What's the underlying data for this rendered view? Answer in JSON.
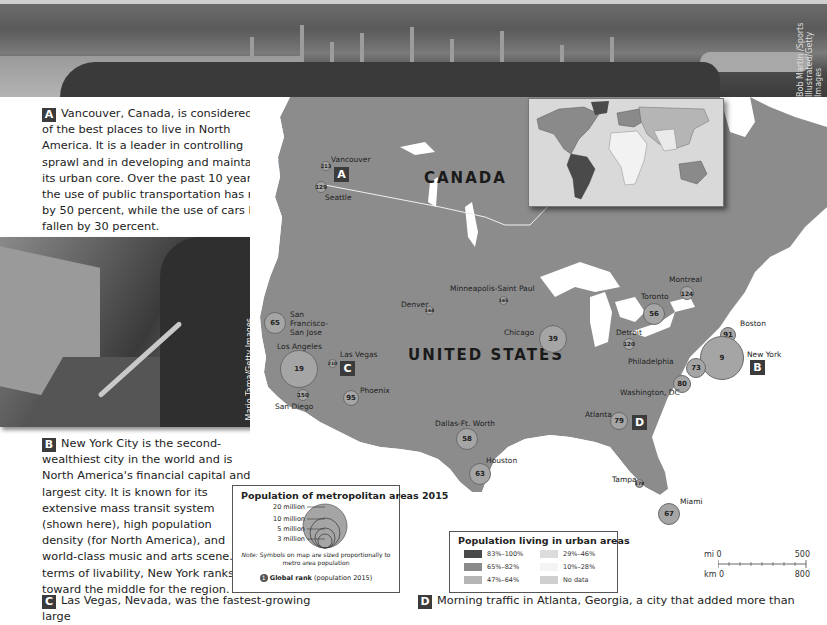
{
  "top_photo": {
    "subject": "Vancouver skyline aerial view",
    "credit": "Bob Martin /Sports Illustrated/Getty Images"
  },
  "sections": {
    "a": {
      "tag": "A",
      "text": "Vancouver, Canada, is considered one of the best places to live in North America. It is a leader in controlling sprawl and in developing and maintaining its urban core. Over the past 10 years, the use of public transportation has risen by 50 percent, while the use of cars has fallen by 30 percent."
    },
    "b": {
      "tag": "B",
      "text": "New York City is the second-wealthiest city in the world and is North America's financial capital and largest city. It is known for its extensive mass transit system (shown here), high population density (for North America), and world-class music and arts scene. In terms of livability, New York ranks toward the middle for the region."
    },
    "c": {
      "tag": "C",
      "text": "Las Vegas, Nevada, was the fastest-growing large"
    },
    "d": {
      "tag": "D",
      "text": "Morning traffic in Atlanta, Georgia, a city that added more than"
    }
  },
  "subway_photo": {
    "subject": "Trumpet player in New York subway station",
    "credit": "Mario Tama/Getty Images"
  },
  "map": {
    "countries": [
      "CANADA",
      "UNITED STATES"
    ],
    "markers": {
      "a": "A",
      "b": "B",
      "c": "C",
      "d": "D"
    },
    "cities": [
      {
        "name": "Vancouver",
        "rank": "213"
      },
      {
        "name": "Seattle",
        "rank": "129"
      },
      {
        "name": "San Francisco-San Jose",
        "rank": "65"
      },
      {
        "name": "Los Angeles",
        "rank": "19"
      },
      {
        "name": "San Diego",
        "rank": "150"
      },
      {
        "name": "Las Vegas",
        "rank": "210"
      },
      {
        "name": "Phoenix",
        "rank": "95"
      },
      {
        "name": "Denver",
        "rank": "164"
      },
      {
        "name": "Minneapolis-Saint Paul",
        "rank": "165"
      },
      {
        "name": "Dallas-Ft. Worth",
        "rank": "58"
      },
      {
        "name": "Houston",
        "rank": "63"
      },
      {
        "name": "Chicago",
        "rank": "39"
      },
      {
        "name": "Detroit",
        "rank": "120"
      },
      {
        "name": "Toronto",
        "rank": "56"
      },
      {
        "name": "Montreal",
        "rank": "124"
      },
      {
        "name": "Boston",
        "rank": "91"
      },
      {
        "name": "New York",
        "rank": "9"
      },
      {
        "name": "Philadelphia",
        "rank": "73"
      },
      {
        "name": "Washington, DC",
        "rank": "80"
      },
      {
        "name": "Atlanta",
        "rank": "79"
      },
      {
        "name": "Tampa",
        "rank": "178"
      },
      {
        "name": "Miami",
        "rank": "67"
      }
    ]
  },
  "legend_population": {
    "title": "Population of metropolitan areas 2015",
    "sizes": [
      "20 million",
      "10 million",
      "5 million",
      "3 million"
    ],
    "note_label": "Note:",
    "note": "Symbols on map are sized proportionally to metro area population",
    "rank_symbol": "1",
    "rank_label": "Global rank",
    "rank_detail": "(population 2015)"
  },
  "legend_urban": {
    "title": "Population living in urban areas",
    "items": [
      {
        "label": "83%–100%",
        "color": "#4a4a4a"
      },
      {
        "label": "65%–82%",
        "color": "#8a8a8a"
      },
      {
        "label": "47%–64%",
        "color": "#b5b5b5"
      },
      {
        "label": "29%–46%",
        "color": "#dcdcdc"
      },
      {
        "label": "10%–28%",
        "color": "#f4f4f4"
      },
      {
        "label": "No data",
        "color": "#cfcfcf"
      }
    ]
  },
  "scale_bar": {
    "mi_label": "mi 0",
    "mi_max": "500",
    "km_label": "km 0",
    "km_max": "800"
  },
  "colors": {
    "land": "#8c8c8c",
    "water": "#ffffff",
    "circle": "#a5a5a5",
    "tag_bg": "#3b3b3b"
  }
}
